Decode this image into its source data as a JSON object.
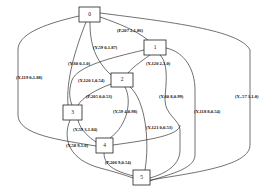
{
  "diagram": {
    "type": "graph",
    "nodes": [
      {
        "id": "0",
        "label": "0"
      },
      {
        "id": "1",
        "label": "1"
      },
      {
        "id": "2",
        "label": "2"
      },
      {
        "id": "3",
        "label": "3"
      },
      {
        "id": "4",
        "label": "4"
      },
      {
        "id": "5",
        "label": "5"
      }
    ],
    "edge_labels": [
      {
        "text": "(P,207 2,1.86)"
      },
      {
        "text": "(Y,59 0,1.87)"
      },
      {
        "text": "(Y,60 0,1.0)"
      },
      {
        "text": "(Y,120 2,1.0)"
      },
      {
        "text": "(Y,119 0,1.88)"
      },
      {
        "text": "(Y,120 1,0.54)"
      },
      {
        "text": "(P,205 0,0.53)"
      },
      {
        "text": "(Y,60 8,0.99)"
      },
      {
        "text": "(Y,-57 3,1.0)"
      },
      {
        "text": "(Y,59 4,0.98)"
      },
      {
        "text": "(Y,118 8,0.54)"
      },
      {
        "text": "(Y,121 0,0.53)"
      },
      {
        "text": "(Y,59 3,1.84)"
      },
      {
        "text": "(Y,58 9,1.0)"
      },
      {
        "text": "(P,206 9,0.54)"
      }
    ]
  }
}
